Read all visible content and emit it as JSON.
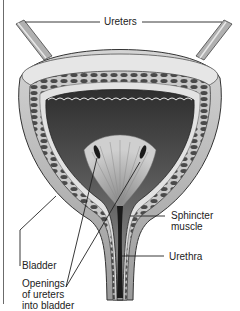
{
  "diagram": {
    "type": "anatomical-illustration",
    "colors": {
      "background": "#ffffff",
      "line": "#222222",
      "outer_wall": "#bdbdbd",
      "muscle_layer": "#7a7a7a",
      "inner_lining": "#3a3a3a",
      "urethra_lumen": "#1a1a1a"
    },
    "labels": {
      "ureters": "Ureters",
      "bladder": "Bladder",
      "openings": "Openings\nof ureters\ninto bladder",
      "sphincter": "Sphincter\nmuscle",
      "urethra": "Urethra"
    }
  }
}
